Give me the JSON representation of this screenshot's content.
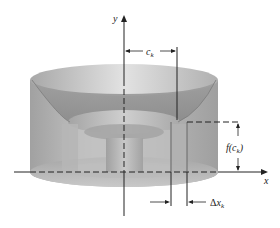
{
  "figure": {
    "axes": {
      "x_label": "x",
      "y_label": "y"
    },
    "annotations": {
      "ck_label_main": "c",
      "ck_label_sub": "k",
      "fck_label_pre": "f(c",
      "fck_label_sub": "k",
      "fck_label_post": ")",
      "dx_label_delta": "Δ",
      "dx_label_main": "x",
      "dx_label_sub": "k"
    },
    "colors": {
      "solid_light": "#d6d6d6",
      "solid_mid": "#b2b2b2",
      "solid_dark": "#8c8c8c",
      "axis": "#222222"
    }
  }
}
